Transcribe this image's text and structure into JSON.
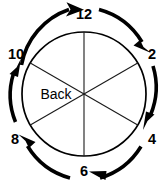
{
  "figure": {
    "center_label": "Back",
    "colors": {
      "stroke": "#000000",
      "spoke": "#1a1a1a",
      "background": "#ffffff"
    },
    "circle": {
      "cx": 84,
      "cy": 94,
      "r": 62
    },
    "rotation": {
      "direction": "clockwise",
      "sequence": "12 to 2 to 4 to 6 to 8 to 10 to 12"
    },
    "hour_labels": [
      {
        "text": "12",
        "clock_position": 12,
        "angle_deg": 90,
        "x": 84,
        "y": 14,
        "anchor": "middle"
      },
      {
        "text": "2",
        "clock_position": 2,
        "angle_deg": 30,
        "x": 152,
        "y": 54,
        "anchor": "middle"
      },
      {
        "text": "4",
        "clock_position": 4,
        "angle_deg": -30,
        "x": 152,
        "y": 139,
        "anchor": "middle"
      },
      {
        "text": "6",
        "clock_position": 6,
        "angle_deg": -90,
        "x": 84,
        "y": 176,
        "anchor": "middle"
      },
      {
        "text": "8",
        "clock_position": 8,
        "angle_deg": -150,
        "x": 15,
        "y": 139,
        "anchor": "middle"
      },
      {
        "text": "10",
        "clock_position": 10,
        "angle_deg": 150,
        "x": 14,
        "y": 54,
        "anchor": "middle"
      }
    ],
    "spokes": [
      {
        "name": "spoke-12-6",
        "from_hour": 12,
        "to_hour": 6
      },
      {
        "name": "spoke-2-8",
        "from_hour": 2,
        "to_hour": 8
      },
      {
        "name": "spoke-10-4",
        "from_hour": 10,
        "to_hour": 4
      }
    ],
    "arc_arrows": [
      {
        "name": "arc-10-to-12",
        "from_hour": 10,
        "to_hour": 12,
        "direction": "clockwise"
      },
      {
        "name": "arc-12-to-2",
        "from_hour": 12,
        "to_hour": 2,
        "direction": "clockwise"
      },
      {
        "name": "arc-2-to-4",
        "from_hour": 2,
        "to_hour": 4,
        "direction": "clockwise"
      },
      {
        "name": "arc-4-to-6",
        "from_hour": 4,
        "to_hour": 6,
        "direction": "clockwise"
      },
      {
        "name": "arc-6-to-8",
        "from_hour": 6,
        "to_hour": 8,
        "direction": "clockwise"
      },
      {
        "name": "arc-8-to-10",
        "from_hour": 8,
        "to_hour": 10,
        "direction": "clockwise"
      }
    ]
  }
}
